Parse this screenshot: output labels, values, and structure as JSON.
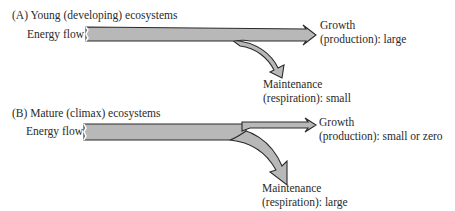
{
  "panels": [
    {
      "id": "A",
      "title": "(A)  Young (developing) ecosystems",
      "input_label": "Energy flow",
      "outputs": {
        "growth": {
          "line1": "Growth",
          "line2": "(production): large"
        },
        "maintenance": {
          "line1": "Maintenance",
          "line2": "(respiration): small"
        }
      }
    },
    {
      "id": "B",
      "title": "(B)  Mature (climax) ecosystems",
      "input_label": "Energy flow",
      "outputs": {
        "growth": {
          "line1": "Growth",
          "line2": "(production): small or zero"
        },
        "maintenance": {
          "line1": "Maintenance",
          "line2": "(respiration): large"
        }
      }
    }
  ],
  "colors": {
    "arrow_fill": "#b8b8b8",
    "arrow_stroke": "#2a2a2a",
    "text": "#2a2a2a"
  }
}
